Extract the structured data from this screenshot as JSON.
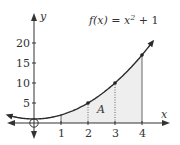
{
  "chart_data": {
    "type": "line",
    "title": "",
    "function_label": "f(x) = x² + 1",
    "function_parts": {
      "prefix": "f(x) = x",
      "exp": "2",
      "suffix": " + 1"
    },
    "xlabel": "x",
    "ylabel": "y",
    "x_ticks": [
      1,
      2,
      3,
      4
    ],
    "y_ticks": [
      5,
      10,
      15,
      20
    ],
    "xlim": [
      -0.95,
      4.9
    ],
    "ylim": [
      -3.5,
      27
    ],
    "series": [
      {
        "name": "f(x) = x^2 + 1",
        "x": [
          -1,
          0,
          1,
          2,
          3,
          4,
          4.4
        ],
        "y": [
          2,
          1,
          2,
          5,
          10,
          17,
          20.36
        ]
      }
    ],
    "marked_points": [
      {
        "x": 2,
        "y": 5
      },
      {
        "x": 3,
        "y": 10
      },
      {
        "x": 4,
        "y": 17
      }
    ],
    "shaded_region": {
      "label": "A",
      "x_from": 1,
      "x_to": 4,
      "under": "f(x)"
    },
    "vertical_lines": [
      {
        "x": 1,
        "style": "solid"
      },
      {
        "x": 2,
        "style": "dotted"
      },
      {
        "x": 3,
        "style": "dotted"
      },
      {
        "x": 4,
        "style": "solid"
      }
    ],
    "origin_marker": "open-circle",
    "grid": false,
    "legend": null
  },
  "colors": {
    "curve": "#2b2b2b",
    "axis": "#333333",
    "shade": "#eeeeee",
    "text": "#333333"
  }
}
